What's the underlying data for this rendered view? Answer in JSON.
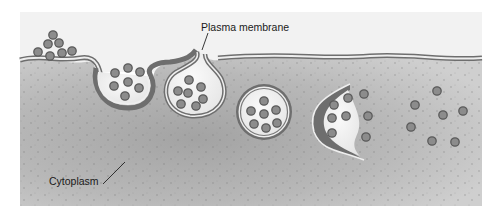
{
  "diagram": {
    "type": "endocytosis illustration",
    "labels": {
      "plasma_membrane": "Plasma membrane",
      "cytoplasm": "Cytoplasm"
    },
    "colors": {
      "background": "#ffffff",
      "extracellular": "#f0f0f0",
      "cytoplasm": "#b5b5b5",
      "cytoplasm_dark": "#9e9e9e",
      "membrane_line": "#6e6e6e",
      "membrane_inner": "#eeeeee",
      "vesicle_fill": "#f2f2f2",
      "particle_fill": "#8a8a8a",
      "particle_stroke": "#555555"
    },
    "stages": [
      "particles outside cell",
      "membrane invagination",
      "vesicle pinching off",
      "free vesicle",
      "vesicle releasing contents",
      "released particles in cytoplasm"
    ]
  }
}
